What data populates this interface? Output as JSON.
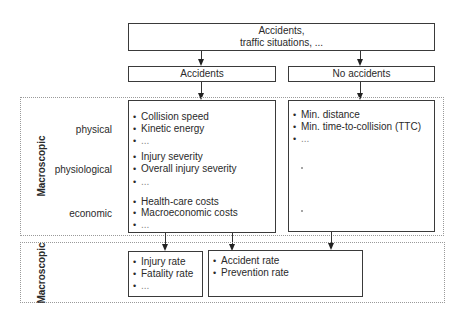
{
  "top": {
    "line1": "Accidents,",
    "line2": "traffic situations, ..."
  },
  "branches": {
    "accidents": "Accidents",
    "no_accidents": "No accidents"
  },
  "section_upper": {
    "label": "Macroscopic",
    "rows": [
      {
        "label": "physical"
      },
      {
        "label": "physiological"
      },
      {
        "label": "economic"
      }
    ],
    "accidents_items": [
      {
        "text": "Collision speed"
      },
      {
        "text": "Kinetic energy"
      },
      {
        "text": "..."
      },
      {
        "text": "Injury severity"
      },
      {
        "text": "Overall injury severity"
      },
      {
        "text": "..."
      },
      {
        "text": "Health-care costs"
      },
      {
        "text": "Macroeconomic costs"
      },
      {
        "text": "..."
      }
    ],
    "no_accidents_items": [
      {
        "text": "Min. distance"
      },
      {
        "text": "Min. time-to-collision (TTC)"
      },
      {
        "text": "..."
      }
    ]
  },
  "section_lower": {
    "label": "Macroscopic",
    "left_items": [
      {
        "text": "Injury rate"
      },
      {
        "text": "Fatality rate"
      },
      {
        "text": "..."
      }
    ],
    "right_items": [
      {
        "text": "Accident rate"
      },
      {
        "text": "Prevention rate"
      }
    ]
  },
  "bullet": "•"
}
